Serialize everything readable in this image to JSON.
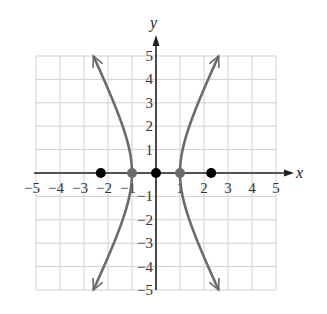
{
  "chart_data": {
    "type": "line",
    "title": "",
    "xlabel": "x",
    "ylabel": "y",
    "xlim": [
      -5,
      5
    ],
    "ylim": [
      -5,
      5
    ],
    "grid": true,
    "x_ticks": [
      "−5",
      "−4",
      "−3",
      "−2",
      "−1",
      "1",
      "2",
      "3",
      "4",
      "5"
    ],
    "y_ticks": [
      "5",
      "4",
      "3",
      "2",
      "1",
      "−1",
      "−2",
      "−3",
      "−4",
      "−5"
    ],
    "series": [
      {
        "name": "hyperbola right branch",
        "equation": "x^2 - y^2/4.3 = 1",
        "x": [
          2.6,
          2.2,
          1.8,
          1.45,
          1.17,
          1.0,
          1.17,
          1.45,
          1.8,
          2.2,
          2.6
        ],
        "y": [
          5,
          4,
          3,
          2,
          1.25,
          0,
          -1.25,
          -2,
          -3,
          -4,
          -5
        ],
        "color": "#6b6b6b",
        "arrows": true
      },
      {
        "name": "hyperbola left branch",
        "equation": "x^2 - y^2/4.3 = 1",
        "x": [
          -2.6,
          -2.2,
          -1.8,
          -1.45,
          -1.17,
          -1.0,
          -1.17,
          -1.45,
          -1.8,
          -2.2,
          -2.6
        ],
        "y": [
          5,
          4,
          3,
          2,
          1.25,
          0,
          -1.25,
          -2,
          -3,
          -4,
          -5
        ],
        "color": "#6b6b6b",
        "arrows": true
      }
    ],
    "points": [
      {
        "label": "focus left",
        "x": -2.3,
        "y": 0,
        "color": "#000000"
      },
      {
        "label": "vertex left",
        "x": -1,
        "y": 0,
        "color": "#6b6b6b"
      },
      {
        "label": "center",
        "x": 0,
        "y": 0,
        "color": "#000000"
      },
      {
        "label": "vertex right",
        "x": 1,
        "y": 0,
        "color": "#6b6b6b"
      },
      {
        "label": "focus right",
        "x": 2.3,
        "y": 0,
        "color": "#000000"
      }
    ],
    "colors": {
      "grid": "#d0d0d0",
      "axis": "#222222",
      "curve": "#6b6b6b"
    }
  }
}
